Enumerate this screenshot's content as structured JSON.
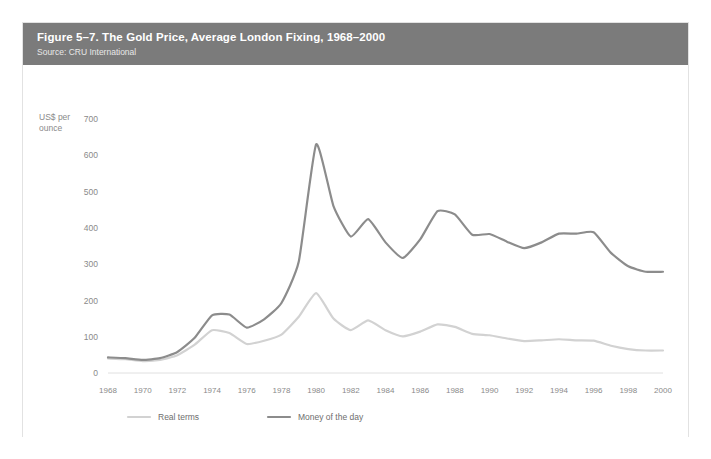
{
  "figure": {
    "title": "Figure 5–7. The Gold Price, Average London Fixing, 1968–2000",
    "source": "Source: CRU International",
    "header_color": "#7b7b7b"
  },
  "axis": {
    "y_label_line1": "US$ per",
    "y_label_line2": "ounce",
    "y_ticks": [
      "0",
      "100",
      "200",
      "300",
      "400",
      "500",
      "600",
      "700"
    ],
    "x_ticks": [
      "1968",
      "1970",
      "1972",
      "1974",
      "1976",
      "1978",
      "1980",
      "1982",
      "1984",
      "1986",
      "1988",
      "1990",
      "1992",
      "1994",
      "1996",
      "1998",
      "2000"
    ]
  },
  "legend": {
    "items": [
      {
        "label": "Real terms",
        "color": "#d2d2d2"
      },
      {
        "label": "Money of the day",
        "color": "#8c8c8c"
      }
    ]
  },
  "chart_data": {
    "type": "line",
    "title": "Figure 5–7. The Gold Price, Average London Fixing, 1968–2000",
    "subtitle": "Source: CRU International",
    "xlabel": "",
    "ylabel": "US$ per ounce",
    "xlim": [
      1968,
      2000
    ],
    "ylim": [
      0,
      700
    ],
    "ytick_step": 100,
    "xtick_step": 2,
    "grid": false,
    "legend_position": "bottom-left",
    "x": [
      1968,
      1969,
      1970,
      1971,
      1972,
      1973,
      1974,
      1975,
      1976,
      1977,
      1978,
      1979,
      1980,
      1981,
      1982,
      1983,
      1984,
      1985,
      1986,
      1987,
      1988,
      1989,
      1990,
      1991,
      1992,
      1993,
      1994,
      1995,
      1996,
      1997,
      1998,
      1999,
      2000
    ],
    "series": [
      {
        "name": "Money of the day",
        "color": "#8c8c8c",
        "values": [
          43,
          41,
          36,
          41,
          58,
          97,
          159,
          161,
          125,
          148,
          193,
          307,
          630,
          460,
          376,
          424,
          360,
          317,
          368,
          446,
          437,
          381,
          383,
          362,
          344,
          360,
          384,
          384,
          388,
          331,
          294,
          279,
          279
        ]
      },
      {
        "name": "Real terms",
        "color": "#d2d2d2",
        "values": [
          40,
          38,
          33,
          36,
          49,
          78,
          118,
          110,
          80,
          89,
          106,
          155,
          220,
          150,
          118,
          145,
          118,
          101,
          114,
          134,
          127,
          108,
          104,
          95,
          88,
          90,
          93,
          90,
          89,
          75,
          66,
          62,
          62
        ]
      }
    ]
  }
}
